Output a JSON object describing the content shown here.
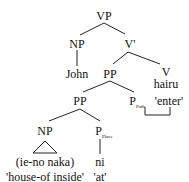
{
  "tree": {
    "root": "VP",
    "np_subject": "NP",
    "subject_word": "John",
    "v_bar": "V'",
    "pp_upper": "PP",
    "v": "V",
    "verb": "hairu",
    "pp_lower": "PP",
    "p_path": "P",
    "p_path_sub": "Path",
    "verb_gloss": "'enter'",
    "np_object": "NP",
    "object_phrase": "(ie-no naka)",
    "object_gloss": "'house-of inside'",
    "p_place": "P",
    "p_place_sub": "Place",
    "postposition": "ni",
    "postposition_gloss": "'at'"
  }
}
